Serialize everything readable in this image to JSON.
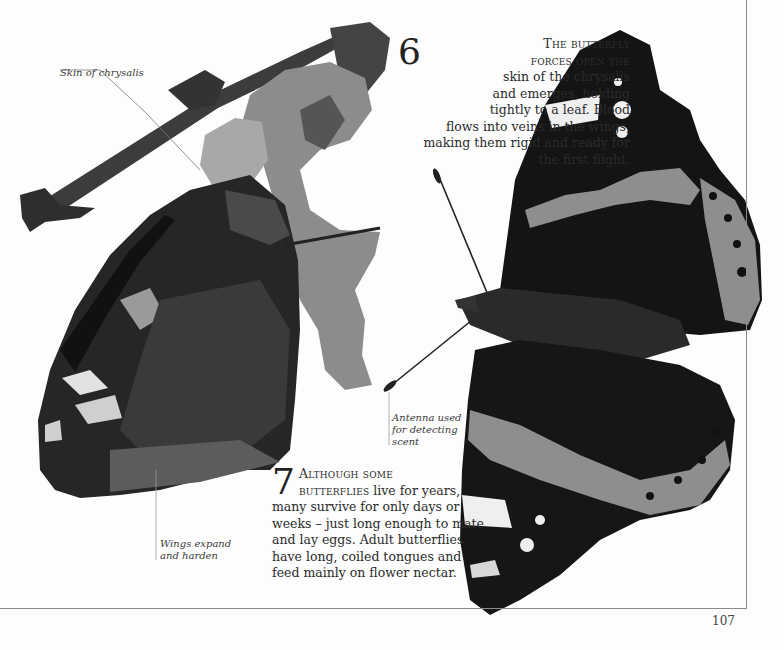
{
  "page": {
    "number": "107",
    "frame_color": "#8a8a8a"
  },
  "steps": [
    {
      "number": "6",
      "lead_in": "The butterfly forces open",
      "lines": [
        "The butterfly",
        "forces open the",
        "skin of the chrysalis",
        "and emerges, holding",
        "tightly to a leaf. Blood",
        "flows into veins in the wings,",
        "making them rigid and ready for",
        "the first flight."
      ],
      "text": "The butterfly forces open the skin of the chrysalis and emerges, holding tightly to a leaf. Blood flows into veins in the wings, making them rigid and ready for the first flight."
    },
    {
      "number": "7",
      "lead_in": "Although some butterflies",
      "lead_in_1": "Although some",
      "lead_in_2": "butterflies",
      "rest": " live for years, many survive for only days or weeks – just long enough to mate and lay eggs. Adult butterflies have long, coiled tongues and feed mainly on flower nectar.",
      "text": "Although some butterflies live for years, many survive for only days or weeks – just long enough to mate and lay eggs. Adult butterflies have long, coiled tongues and feed mainly on flower nectar."
    }
  ],
  "captions": {
    "skin": "Skin of chrysalis",
    "wings_1": "Wings expand",
    "wings_2": "and harden",
    "antenna_1": "Antenna used",
    "antenna_2": "for detecting",
    "antenna_3": "scent"
  },
  "images": {
    "left": "Butterfly emerging from chrysalis on twig, wings folded",
    "right": "Adult butterfly with wings open, seen from above",
    "colors": {
      "wing_dark": "#161616",
      "band_gray": "#8f8f8f",
      "spot_white": "#f0f0f0",
      "leaf_gray": "#8a8a8a",
      "twig": "#3a3a3a"
    }
  }
}
